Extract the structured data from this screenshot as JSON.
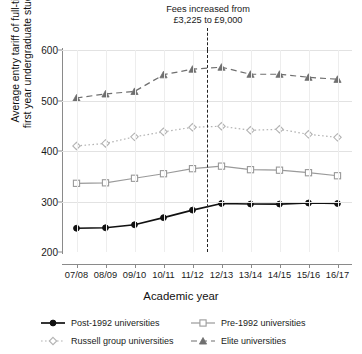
{
  "chart_data": {
    "type": "line",
    "title": "",
    "xlabel": "Academic year",
    "ylabel": "Average entry tariff of full-time,\nfirst year undergraduate students",
    "categories": [
      "07/08",
      "08/09",
      "09/10",
      "10/11",
      "11/12",
      "12/13",
      "13/14",
      "14/15",
      "15/16",
      "16/17"
    ],
    "ylim": [
      200,
      600
    ],
    "yticks": [
      200,
      300,
      400,
      500,
      600
    ],
    "grid": true,
    "legend_position": "bottom",
    "annotation": {
      "text": "Fees increased from\n£3,225 to £9,000",
      "line_between": [
        "11/12",
        "12/13"
      ]
    },
    "series": [
      {
        "name": "Post-1992 universities",
        "marker": "filled-circle",
        "line": "solid",
        "color": "#111111",
        "values": [
          247,
          248,
          254,
          268,
          283,
          296,
          295,
          295,
          297,
          296
        ]
      },
      {
        "name": "Pre-1992 universities",
        "marker": "open-square",
        "line": "solid",
        "color": "#9a9a9a",
        "values": [
          336,
          337,
          346,
          355,
          365,
          370,
          363,
          362,
          357,
          351
        ]
      },
      {
        "name": "Russell group universities",
        "marker": "open-diamond",
        "line": "dotted",
        "color": "#b3b3b3",
        "values": [
          410,
          415,
          428,
          438,
          447,
          449,
          441,
          443,
          433,
          427
        ]
      },
      {
        "name": "Elite universities",
        "marker": "filled-triangle",
        "line": "dashed",
        "color": "#6f6f6f",
        "values": [
          505,
          513,
          518,
          551,
          562,
          566,
          552,
          552,
          546,
          542
        ]
      }
    ]
  },
  "legend": {
    "items": [
      {
        "label": "Post-1992 universities"
      },
      {
        "label": "Pre-1992 universities"
      },
      {
        "label": "Russell group universities"
      },
      {
        "label": "Elite universities"
      }
    ]
  }
}
